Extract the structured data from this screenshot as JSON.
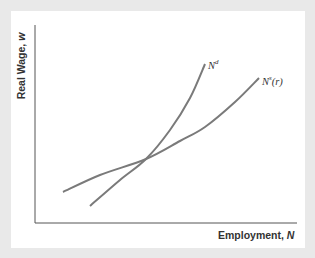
{
  "chart_data": {
    "type": "line",
    "title": "",
    "xlabel": "Employment, N",
    "ylabel": "Real Wage, w",
    "xlabel_text": "Employment,",
    "xlabel_var": "N",
    "ylabel_text": "Real Wage,",
    "ylabel_var": "w",
    "grid": false,
    "ticks": "none",
    "series": [
      {
        "name": "N^d",
        "label_base": "N",
        "label_sup": "d",
        "label_suffix": "",
        "color": "#7a7a7a",
        "points_px": [
          [
            90,
            206
          ],
          [
            120,
            180
          ],
          [
            146,
            159
          ],
          [
            170,
            130
          ],
          [
            190,
            98
          ],
          [
            205,
            64
          ]
        ]
      },
      {
        "name": "N^s(r)",
        "label_base": "N",
        "label_sup": "s",
        "label_suffix": "(r)",
        "color": "#7a7a7a",
        "points_px": [
          [
            63,
            192
          ],
          [
            100,
            175
          ],
          [
            146,
            159
          ],
          [
            180,
            141
          ],
          [
            205,
            127
          ],
          [
            235,
            102
          ],
          [
            259,
            78
          ]
        ]
      }
    ],
    "annotations": [
      "Intersection of N^d and N^s(r) curves (equilibrium)"
    ]
  },
  "colors": {
    "background": "#e9e9e9",
    "panel": "#ffffff",
    "axis": "#555555",
    "curve": "#7a7a7a",
    "text": "#333333"
  }
}
